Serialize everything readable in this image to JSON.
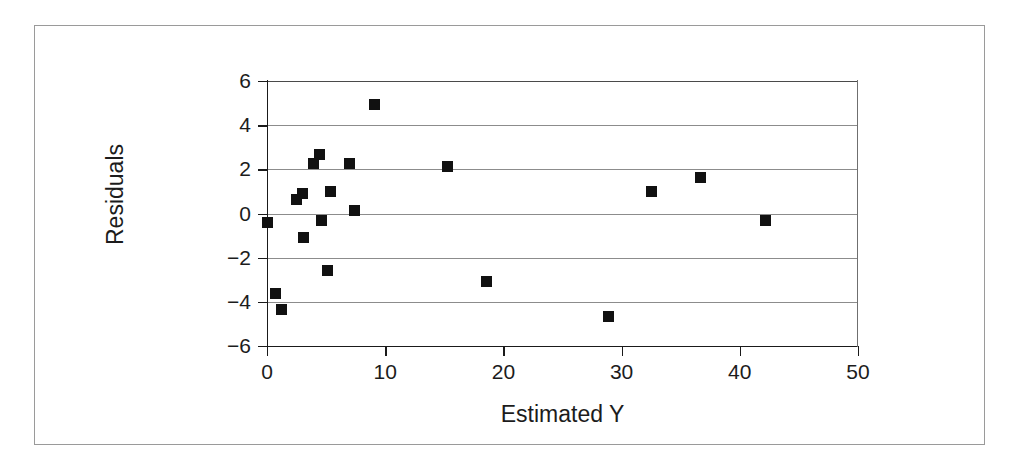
{
  "figure": {
    "border_color": "#9a9a9a",
    "background": "#ffffff"
  },
  "chart_data": {
    "type": "scatter",
    "title": "",
    "xlabel": "Estimated Y",
    "ylabel": "Residuals",
    "xlim": [
      0,
      50
    ],
    "ylim": [
      -6,
      6
    ],
    "xticks": [
      0,
      10,
      20,
      30,
      40,
      50
    ],
    "yticks": [
      -6,
      -4,
      -2,
      0,
      2,
      4,
      6
    ],
    "xtick_labels": [
      "0",
      "10",
      "20",
      "30",
      "40",
      "50"
    ],
    "ytick_labels": [
      "−6",
      "−4",
      "−2",
      "0",
      "2",
      "4",
      "6"
    ],
    "grid": "horizontal",
    "legend": "none",
    "marker": "square",
    "marker_color": "#111111",
    "marker_size_px": 11,
    "points": [
      {
        "x": 0.0,
        "y": -0.4
      },
      {
        "x": 0.7,
        "y": -3.6
      },
      {
        "x": 1.2,
        "y": -4.35
      },
      {
        "x": 2.5,
        "y": 0.65
      },
      {
        "x": 3.0,
        "y": 0.9
      },
      {
        "x": 3.1,
        "y": -1.1
      },
      {
        "x": 3.9,
        "y": 2.25
      },
      {
        "x": 4.4,
        "y": 2.65
      },
      {
        "x": 4.6,
        "y": -0.3
      },
      {
        "x": 5.4,
        "y": 1.0
      },
      {
        "x": 5.1,
        "y": -2.6
      },
      {
        "x": 7.0,
        "y": 2.25
      },
      {
        "x": 7.4,
        "y": 0.15
      },
      {
        "x": 9.1,
        "y": 4.95
      },
      {
        "x": 15.3,
        "y": 2.15
      },
      {
        "x": 18.6,
        "y": -3.1
      },
      {
        "x": 28.9,
        "y": -4.65
      },
      {
        "x": 32.5,
        "y": 1.0
      },
      {
        "x": 36.7,
        "y": 1.65
      },
      {
        "x": 42.2,
        "y": -0.3
      }
    ]
  }
}
